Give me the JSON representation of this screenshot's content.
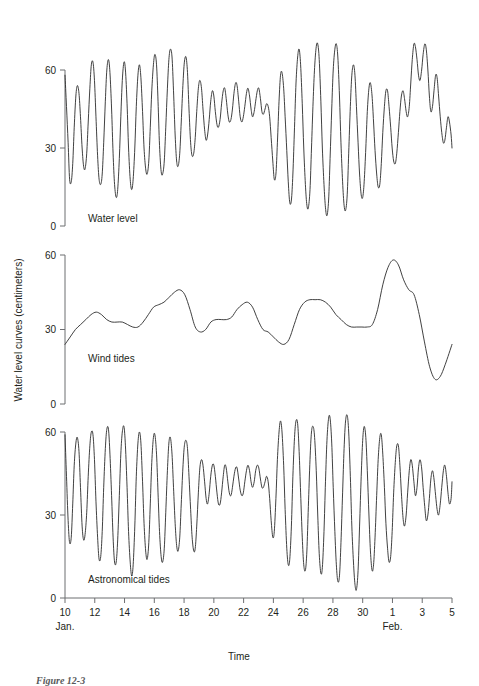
{
  "figure": {
    "caption": "Figure 12-3",
    "y_axis_title": "Water level curves (centimeters)",
    "x_axis_title": "Time"
  },
  "chart_data": {
    "type": "line",
    "title": "",
    "xlabel": "Time",
    "ylabel": "Water level curves (centimeters)",
    "xlim": [
      10,
      36
    ],
    "ylim": [
      0,
      70
    ],
    "grid": false,
    "legend": "none",
    "x_tick_labels": [
      "10",
      "12",
      "14",
      "16",
      "18",
      "20",
      "22",
      "24",
      "26",
      "28",
      "30",
      "1",
      "3",
      "5"
    ],
    "x_tick_values": [
      10,
      12,
      14,
      16,
      18,
      20,
      22,
      24,
      26,
      28,
      30,
      32,
      34,
      36
    ],
    "x_month_labels": [
      {
        "label": "Jan.",
        "at": 10
      },
      {
        "label": "Feb.",
        "at": 32
      }
    ],
    "y_tick_labels": [
      "0",
      "30",
      "60"
    ],
    "y_tick_values": [
      0,
      30,
      60
    ],
    "panels": [
      {
        "name": "water-level",
        "label": "Water level",
        "series_name": "Water level",
        "x": [
          10.0,
          10.1,
          10.21,
          10.31,
          10.42,
          10.52,
          10.62,
          10.73,
          10.83,
          10.94,
          11.04,
          11.15,
          11.25,
          11.35,
          11.46,
          11.56,
          11.67,
          11.77,
          11.88,
          11.98,
          12.08,
          12.19,
          12.29,
          12.4,
          12.5,
          12.6,
          12.71,
          12.81,
          12.92,
          13.02,
          13.13,
          13.23,
          13.33,
          13.44,
          13.54,
          13.65,
          13.75,
          13.85,
          13.96,
          14.06,
          14.17,
          14.27,
          14.38,
          14.48,
          14.58,
          14.69,
          14.79,
          14.9,
          15.0,
          15.1,
          15.21,
          15.31,
          15.42,
          15.52,
          15.63,
          15.73,
          15.83,
          15.94,
          16.04,
          16.15,
          16.25,
          16.35,
          16.46,
          16.56,
          16.67,
          16.77,
          16.88,
          16.98,
          17.08,
          17.19,
          17.29,
          17.4,
          17.5,
          17.6,
          17.71,
          17.81,
          17.92,
          18.02,
          18.13,
          18.23,
          18.33,
          18.44,
          18.54,
          18.65,
          18.75,
          18.85,
          18.96,
          19.06,
          19.17,
          19.27,
          19.38,
          19.48,
          19.58,
          19.69,
          19.79,
          19.9,
          20.0,
          20.1,
          20.21,
          20.31,
          20.42,
          20.52,
          20.63,
          20.73,
          20.83,
          20.94,
          21.04,
          21.15,
          21.25,
          21.35,
          21.46,
          21.56,
          21.67,
          21.77,
          21.88,
          21.98,
          22.08,
          22.19,
          22.29,
          22.4,
          22.5,
          22.6,
          22.71,
          22.81,
          22.92,
          23.02,
          23.13,
          23.23,
          23.33,
          23.44,
          23.54,
          23.65,
          23.75,
          23.85,
          23.96,
          24.06,
          24.17,
          24.27,
          24.38,
          24.48,
          24.58,
          24.69,
          24.79,
          24.9,
          25.0,
          25.1,
          25.21,
          25.31,
          25.42,
          25.52,
          25.63,
          25.73,
          25.83,
          25.94,
          26.04,
          26.15,
          26.25,
          26.35,
          26.46,
          26.56,
          26.67,
          26.77,
          26.88,
          26.98,
          27.08,
          27.19,
          27.29,
          27.4,
          27.5,
          27.6,
          27.71,
          27.81,
          27.92,
          28.02,
          28.13,
          28.23,
          28.33,
          28.44,
          28.54,
          28.65,
          28.75,
          28.85,
          28.96,
          29.06,
          29.17,
          29.27,
          29.38,
          29.48,
          29.58,
          29.69,
          29.79,
          29.9,
          30.0,
          30.1,
          30.21,
          30.31,
          30.42,
          30.52,
          30.63,
          30.73,
          30.83,
          30.94,
          31.04,
          31.15,
          31.25,
          31.35,
          31.46,
          31.56,
          31.67,
          31.77,
          31.88,
          31.98,
          32.08,
          32.19,
          32.29,
          32.4,
          32.5,
          32.6,
          32.71,
          32.81,
          32.92,
          33.02,
          33.13,
          33.23,
          33.33,
          33.44,
          33.54,
          33.65,
          33.75,
          33.85,
          33.96,
          34.06,
          34.17,
          34.27,
          34.38,
          34.48,
          34.58,
          34.69,
          34.79,
          34.9,
          35.0,
          35.1,
          35.21,
          35.31,
          35.42,
          35.52,
          35.63,
          35.73,
          35.83,
          35.94,
          36.0
        ],
        "y": [
          58,
          46,
          32,
          18,
          17,
          24,
          38,
          50,
          54,
          51,
          42,
          30,
          23,
          22,
          28,
          40,
          53,
          62,
          63,
          56,
          42,
          27,
          18,
          16,
          20,
          32,
          48,
          60,
          64,
          59,
          45,
          28,
          16,
          11,
          14,
          26,
          42,
          56,
          63,
          60,
          47,
          30,
          18,
          14,
          18,
          30,
          46,
          58,
          62,
          57,
          44,
          30,
          22,
          20,
          25,
          38,
          52,
          62,
          66,
          62,
          48,
          31,
          21,
          20,
          25,
          38,
          53,
          64,
          68,
          65,
          52,
          35,
          25,
          23,
          28,
          40,
          54,
          63,
          65,
          59,
          45,
          32,
          27,
          28,
          34,
          44,
          53,
          56,
          53,
          45,
          37,
          33,
          35,
          41,
          48,
          52,
          50,
          44,
          39,
          38,
          41,
          47,
          52,
          53,
          49,
          43,
          40,
          41,
          45,
          51,
          55,
          54,
          48,
          42,
          40,
          42,
          46,
          51,
          53,
          50,
          45,
          42,
          44,
          48,
          52,
          53,
          49,
          44,
          43,
          45,
          47,
          46,
          42,
          34,
          25,
          18,
          20,
          32,
          48,
          58,
          59,
          53,
          42,
          29,
          17,
          9,
          10,
          20,
          38,
          55,
          65,
          68,
          62,
          47,
          30,
          16,
          8,
          7,
          14,
          30,
          48,
          61,
          69,
          70,
          64,
          48,
          30,
          16,
          7,
          4,
          10,
          26,
          45,
          60,
          68,
          70,
          65,
          50,
          32,
          17,
          8,
          6,
          12,
          28,
          46,
          58,
          62,
          58,
          46,
          32,
          20,
          12,
          11,
          17,
          30,
          44,
          53,
          55,
          50,
          40,
          29,
          20,
          15,
          16,
          24,
          36,
          46,
          52,
          52,
          46,
          38,
          30,
          25,
          24,
          28,
          36,
          44,
          50,
          52,
          49,
          44,
          42,
          46,
          55,
          64,
          70,
          69,
          64,
          58,
          56,
          60,
          66,
          70,
          68,
          60,
          50,
          44,
          46,
          52,
          58,
          57,
          50,
          42,
          36,
          32,
          33,
          38,
          42,
          40,
          35,
          30,
          28,
          30,
          33,
          34,
          32,
          30,
          29,
          30,
          33,
          36,
          38,
          36,
          33,
          30,
          28,
          27,
          28,
          31,
          34,
          36,
          35,
          32,
          30
        ]
      },
      {
        "name": "wind-tides",
        "label": "Wind tides",
        "series_name": "Wind tides",
        "x": [
          10.0,
          10.35,
          10.7,
          11.05,
          11.4,
          11.75,
          12.1,
          12.45,
          12.8,
          13.15,
          13.5,
          13.85,
          14.2,
          14.55,
          14.9,
          15.25,
          15.6,
          15.95,
          16.3,
          16.65,
          17.0,
          17.35,
          17.7,
          18.05,
          18.4,
          18.75,
          19.1,
          19.45,
          19.8,
          20.15,
          20.5,
          20.85,
          21.2,
          21.55,
          21.9,
          22.25,
          22.6,
          22.95,
          23.3,
          23.65,
          24.0,
          24.35,
          24.7,
          25.05,
          25.4,
          25.75,
          26.1,
          26.45,
          26.8,
          27.15,
          27.5,
          27.85,
          28.2,
          28.55,
          28.9,
          29.25,
          29.6,
          29.95,
          30.3,
          30.65,
          31.0,
          31.35,
          31.7,
          32.05,
          32.4,
          32.75,
          33.1,
          33.45,
          33.8,
          34.15,
          34.5,
          34.85,
          35.2,
          35.55,
          36.0
        ],
        "y": [
          24,
          27,
          30,
          32,
          34,
          36,
          37,
          36,
          34,
          33,
          33,
          33,
          32,
          31,
          31,
          33,
          36,
          39,
          40,
          41,
          43,
          45,
          46,
          44,
          38,
          31,
          29,
          30,
          33,
          34,
          34,
          34,
          35,
          38,
          40,
          41,
          39,
          34,
          30,
          29,
          27,
          25,
          24,
          26,
          32,
          38,
          41,
          42,
          42,
          42,
          41,
          39,
          36,
          34,
          32,
          31,
          31,
          31,
          31,
          32,
          38,
          48,
          55,
          58,
          56,
          50,
          46,
          44,
          36,
          25,
          15,
          10,
          11,
          16,
          24
        ]
      },
      {
        "name": "astronomical-tides",
        "label": "Astronomical tides",
        "series_name": "Astronomical tides",
        "x": [
          10.0,
          10.1,
          10.21,
          10.31,
          10.42,
          10.52,
          10.62,
          10.73,
          10.83,
          10.94,
          11.04,
          11.15,
          11.25,
          11.35,
          11.46,
          11.56,
          11.67,
          11.77,
          11.88,
          11.98,
          12.08,
          12.19,
          12.29,
          12.4,
          12.5,
          12.6,
          12.71,
          12.81,
          12.92,
          13.02,
          13.13,
          13.23,
          13.33,
          13.44,
          13.54,
          13.65,
          13.75,
          13.85,
          13.96,
          14.06,
          14.17,
          14.27,
          14.38,
          14.48,
          14.58,
          14.69,
          14.79,
          14.9,
          15.0,
          15.1,
          15.21,
          15.31,
          15.42,
          15.52,
          15.63,
          15.73,
          15.83,
          15.94,
          16.04,
          16.15,
          16.25,
          16.35,
          16.46,
          16.56,
          16.67,
          16.77,
          16.88,
          16.98,
          17.08,
          17.19,
          17.29,
          17.4,
          17.5,
          17.6,
          17.71,
          17.81,
          17.92,
          18.02,
          18.13,
          18.23,
          18.33,
          18.44,
          18.54,
          18.65,
          18.75,
          18.85,
          18.96,
          19.06,
          19.17,
          19.27,
          19.38,
          19.48,
          19.58,
          19.69,
          19.79,
          19.9,
          20.0,
          20.1,
          20.21,
          20.31,
          20.42,
          20.52,
          20.63,
          20.73,
          20.83,
          20.94,
          21.04,
          21.15,
          21.25,
          21.35,
          21.46,
          21.56,
          21.67,
          21.77,
          21.88,
          21.98,
          22.08,
          22.19,
          22.29,
          22.4,
          22.5,
          22.6,
          22.71,
          22.81,
          22.92,
          23.02,
          23.13,
          23.23,
          23.33,
          23.44,
          23.54,
          23.65,
          23.75,
          23.85,
          23.96,
          24.06,
          24.17,
          24.27,
          24.38,
          24.48,
          24.58,
          24.69,
          24.79,
          24.9,
          25.0,
          25.1,
          25.21,
          25.31,
          25.42,
          25.52,
          25.63,
          25.73,
          25.83,
          25.94,
          26.04,
          26.15,
          26.25,
          26.35,
          26.46,
          26.56,
          26.67,
          26.77,
          26.88,
          26.98,
          27.08,
          27.19,
          27.29,
          27.4,
          27.5,
          27.6,
          27.71,
          27.81,
          27.92,
          28.02,
          28.13,
          28.23,
          28.33,
          28.44,
          28.54,
          28.65,
          28.75,
          28.85,
          28.96,
          29.06,
          29.17,
          29.27,
          29.38,
          29.48,
          29.58,
          29.69,
          29.79,
          29.9,
          30.0,
          30.1,
          30.21,
          30.31,
          30.42,
          30.52,
          30.63,
          30.73,
          30.83,
          30.94,
          31.04,
          31.15,
          31.25,
          31.35,
          31.46,
          31.56,
          31.67,
          31.77,
          31.88,
          31.98,
          32.08,
          32.19,
          32.29,
          32.4,
          32.5,
          32.6,
          32.71,
          32.81,
          32.92,
          33.02,
          33.13,
          33.23,
          33.33,
          33.44,
          33.54,
          33.65,
          33.75,
          33.85,
          33.96,
          34.06,
          34.17,
          34.27,
          34.38,
          34.48,
          34.58,
          34.69,
          34.79,
          34.9,
          35.0,
          35.1,
          35.21,
          35.31,
          35.42,
          35.52,
          35.63,
          35.73,
          35.83,
          35.94,
          36.0
        ],
        "y": [
          59,
          44,
          28,
          20,
          22,
          34,
          48,
          56,
          58,
          53,
          40,
          26,
          21,
          23,
          31,
          44,
          55,
          60,
          59,
          50,
          35,
          22,
          14,
          15,
          24,
          40,
          54,
          61,
          61,
          52,
          37,
          22,
          13,
          13,
          21,
          37,
          52,
          60,
          62,
          55,
          40,
          24,
          13,
          8,
          12,
          26,
          44,
          56,
          60,
          56,
          42,
          27,
          17,
          14,
          20,
          34,
          49,
          58,
          59,
          52,
          38,
          24,
          15,
          13,
          18,
          31,
          46,
          56,
          58,
          52,
          40,
          27,
          19,
          17,
          22,
          34,
          47,
          55,
          57,
          54,
          44,
          32,
          22,
          17,
          18,
          26,
          38,
          47,
          50,
          48,
          42,
          36,
          34,
          38,
          44,
          48,
          48,
          44,
          38,
          34,
          34,
          38,
          44,
          48,
          47,
          42,
          38,
          37,
          40,
          44,
          47,
          47,
          43,
          39,
          37,
          38,
          42,
          46,
          48,
          46,
          42,
          40,
          42,
          46,
          48,
          47,
          43,
          40,
          40,
          42,
          44,
          42,
          36,
          28,
          22,
          24,
          36,
          50,
          60,
          64,
          60,
          48,
          32,
          18,
          12,
          14,
          26,
          44,
          58,
          64,
          63,
          53,
          38,
          22,
          12,
          10,
          17,
          33,
          50,
          60,
          62,
          58,
          46,
          30,
          16,
          9,
          11,
          24,
          42,
          57,
          65,
          65,
          56,
          40,
          24,
          12,
          6,
          8,
          20,
          38,
          54,
          64,
          66,
          60,
          44,
          26,
          13,
          5,
          3,
          10,
          26,
          44,
          57,
          62,
          58,
          46,
          30,
          17,
          10,
          12,
          22,
          37,
          50,
          58,
          59,
          52,
          40,
          27,
          18,
          13,
          15,
          24,
          38,
          49,
          55,
          55,
          48,
          38,
          29,
          26,
          30,
          38,
          46,
          50,
          48,
          42,
          37,
          40,
          47,
          50,
          47,
          40,
          33,
          28,
          30,
          36,
          43,
          46,
          43,
          37,
          32,
          30,
          34,
          40,
          46,
          48,
          44,
          38,
          34,
          36,
          42,
          46,
          45,
          40,
          38
        ]
      }
    ]
  }
}
